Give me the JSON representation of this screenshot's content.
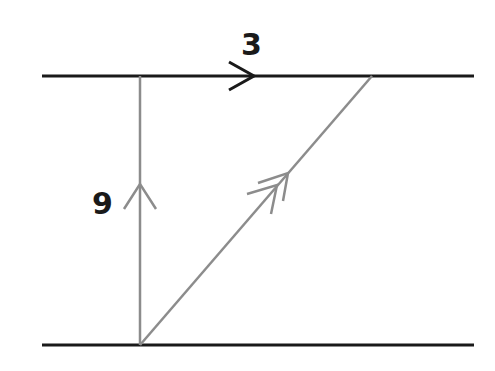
{
  "diagram": {
    "type": "vector-diagram",
    "labels": {
      "top_vector": "3",
      "left_vector": "9"
    },
    "colors": {
      "bank_line": "#1a1a1a",
      "vector_line": "#8c8c8c",
      "label": "#1a1a1a",
      "background": "#ffffff"
    },
    "elements": [
      {
        "name": "top-bank",
        "from": [
          42,
          76
        ],
        "to": [
          474,
          76
        ]
      },
      {
        "name": "bottom-bank",
        "from": [
          42,
          345
        ],
        "to": [
          474,
          345
        ]
      },
      {
        "name": "vertical-vector",
        "from": [
          140,
          345
        ],
        "to": [
          140,
          76
        ],
        "label": "9",
        "arrow": "single"
      },
      {
        "name": "horizontal-vector",
        "on": "top-bank",
        "label": "3",
        "arrow": "single",
        "direction": "right"
      },
      {
        "name": "resultant-vector",
        "from": [
          140,
          345
        ],
        "to": [
          372,
          76
        ],
        "arrow": "double"
      }
    ]
  }
}
